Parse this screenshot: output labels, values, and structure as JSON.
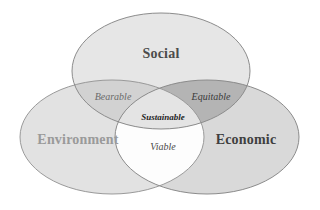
{
  "diagram": {
    "background_color": "#ffffff",
    "type": "three-set-venn",
    "sets": [
      {
        "key": "social",
        "label": "Social",
        "label_color": "#4c4c4c",
        "fill_color": "#e6e6e6",
        "stroke_color": "#8c8c8c",
        "label_x": 161,
        "label_y": 55,
        "font_size": 14,
        "cx": 161,
        "cy": 71,
        "rx": 89,
        "ry": 58
      },
      {
        "key": "environment",
        "label": "Environment",
        "label_color": "#9a9a9a",
        "fill_color": "#e2e2e2",
        "stroke_color": "#9a9a9a",
        "label_x": 78,
        "label_y": 141,
        "font_size": 14,
        "cx": 112,
        "cy": 137,
        "rx": 92,
        "ry": 57
      },
      {
        "key": "economic",
        "label": "Economic",
        "label_color": "#3f3f3f",
        "fill_color": "#d9d9d9",
        "stroke_color": "#8c8c8c",
        "label_x": 246,
        "label_y": 141,
        "font_size": 14,
        "cx": 207,
        "cy": 137,
        "rx": 92,
        "ry": 57
      }
    ],
    "intersections": [
      {
        "key": "bearable",
        "label": "Bearable",
        "between": "Social + Environment",
        "label_color": "#6b6b6b",
        "fill_color": "#d2d2d2",
        "label_x": 113,
        "label_y": 98,
        "font_size": 10
      },
      {
        "key": "equitable",
        "label": "Equitable",
        "between": "Social + Economic",
        "label_color": "#3a3a3a",
        "fill_color": "#b4b4b4",
        "label_x": 211,
        "label_y": 98,
        "font_size": 10
      },
      {
        "key": "viable",
        "label": "Viable",
        "between": "Environment + Economic",
        "label_color": "#4a4a4a",
        "fill_color": "#fdfdfd",
        "label_x": 163,
        "label_y": 148,
        "font_size": 10
      },
      {
        "key": "sustainable",
        "label": "Sustainable",
        "between": "Social + Environment + Economic",
        "label_color": "#1f1f1f",
        "fill_color": "#e4e4e4",
        "label_x": 163,
        "label_y": 118,
        "font_size": 9
      }
    ]
  }
}
